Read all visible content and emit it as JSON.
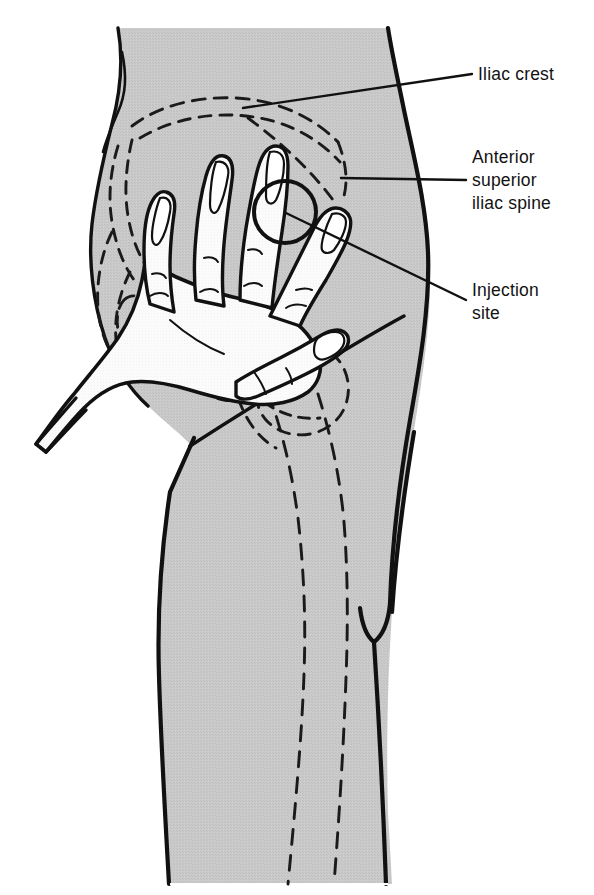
{
  "figure": {
    "background_color": "#ffffff",
    "skin_fill": "#c9c9c9",
    "hand_fill": "#fbfbfb",
    "outline_color": "#111111",
    "dashed_bone_color": "#1a1a1a"
  },
  "labels": [
    {
      "id": "iliac-crest",
      "text": "Iliac crest",
      "lines": [
        "Iliac crest"
      ],
      "x": 478,
      "y": 80,
      "leader": {
        "from_x": 472,
        "from_y": 74,
        "to_x": 243,
        "to_y": 108
      }
    },
    {
      "id": "anterior-superior-iliac-spine",
      "text": "Anterior superior iliac spine",
      "lines": [
        "Anterior",
        "superior",
        "iliac spine"
      ],
      "x": 472,
      "y": 163,
      "leader": {
        "from_x": 466,
        "from_y": 180,
        "to_x": 341,
        "to_y": 178
      }
    },
    {
      "id": "injection-site",
      "text": "Injection site",
      "lines": [
        "Injection",
        "site"
      ],
      "x": 472,
      "y": 296,
      "leader": {
        "from_x": 466,
        "from_y": 300,
        "to_x": 286,
        "to_y": 213
      }
    }
  ],
  "markers": {
    "injection_circle": {
      "name": "injection-site-circle",
      "center_x": 285,
      "center_y": 212,
      "radius": 31
    }
  },
  "anatomy": {
    "landmarks": [
      "Iliac crest",
      "Anterior superior iliac spine",
      "Injection site"
    ],
    "hidden_structures": [
      "pelvis",
      "ilium",
      "greater trochanter",
      "femur"
    ],
    "hand": {
      "fingers": 4,
      "thumb": 1,
      "position": "palm on greater trochanter, index on anterior superior iliac spine"
    }
  }
}
